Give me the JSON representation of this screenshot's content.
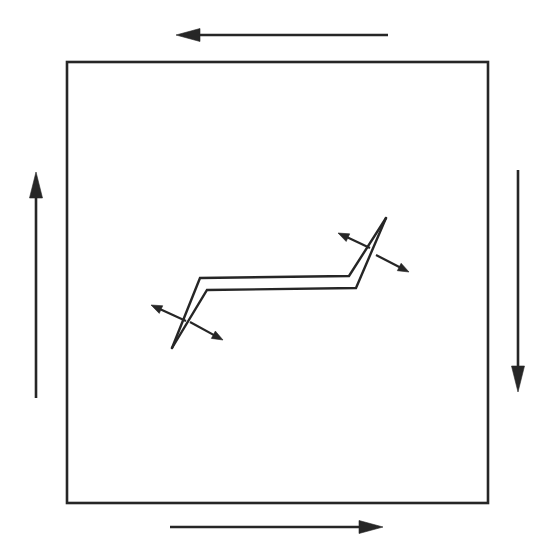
{
  "figure": {
    "title": "Zigzag shear band within a square domain under counterclockwise boundary shear",
    "background_color": "#ffffff",
    "ink_color": "#262626",
    "width": 550,
    "height": 543
  },
  "boundary": {
    "name": "square-boundary",
    "shape": "square",
    "left": 67,
    "top": 62,
    "right": 488,
    "bottom": 503,
    "stroke_color": "#262626",
    "stroke_width": 2.6,
    "fill": "none"
  },
  "circulation_arrows": [
    {
      "id": "top-shear-arrow",
      "label": "top boundary shear",
      "direction": "left",
      "orientation": "horizontal",
      "start_x": 388,
      "start_y": 35,
      "end_x": 176,
      "end_y": 35,
      "head_length": 24,
      "head_half_width": 6.5,
      "stroke_width": 2.6
    },
    {
      "id": "right-shear-arrow",
      "label": "right boundary shear",
      "direction": "down",
      "orientation": "vertical",
      "start_x": 518,
      "start_y": 170,
      "end_x": 518,
      "end_y": 392,
      "head_length": 26,
      "head_half_width": 6.5,
      "stroke_width": 2.6
    },
    {
      "id": "bottom-shear-arrow",
      "label": "bottom boundary shear",
      "direction": "right",
      "orientation": "horizontal",
      "start_x": 170,
      "start_y": 527,
      "end_x": 383,
      "end_y": 527,
      "head_length": 24,
      "head_half_width": 6.5,
      "stroke_width": 2.6
    },
    {
      "id": "left-shear-arrow",
      "label": "left boundary shear",
      "direction": "up",
      "orientation": "vertical",
      "start_x": 36,
      "start_y": 398,
      "end_x": 36,
      "end_y": 172,
      "head_length": 26,
      "head_half_width": 6.5,
      "stroke_width": 2.6
    }
  ],
  "shear_band": {
    "name": "zigzag-shear-band",
    "description": "Z-shaped double-line band with tapered tips at lower-left and upper-right",
    "stroke_color": "#262626",
    "stroke_width": 2.4,
    "upper_polyline": "172,348 200,278 349,276 386,218",
    "lower_polyline": "172,348 207,290 356,288 386,218",
    "tip_lower_left": {
      "x": 172,
      "y": 348
    },
    "tip_upper_right": {
      "x": 386,
      "y": 218
    },
    "bend_left_upper": {
      "x": 200,
      "y": 278
    },
    "bend_left_lower": {
      "x": 207,
      "y": 290
    },
    "bend_right_upper": {
      "x": 349,
      "y": 276
    },
    "bend_right_lower": {
      "x": 356,
      "y": 288
    }
  },
  "local_arrows": [
    {
      "id": "upper-right-slip-arrow-nw",
      "label": "upper-right slip direction, up-left",
      "start_x": 370,
      "start_y": 248,
      "end_x": 338,
      "end_y": 233,
      "head_length": 11,
      "head_half_width": 4.2,
      "stroke_width": 2.2
    },
    {
      "id": "upper-right-slip-arrow-se",
      "label": "upper-right slip direction, down-right",
      "start_x": 376,
      "start_y": 255,
      "end_x": 409,
      "end_y": 272,
      "head_length": 11,
      "head_half_width": 4.2,
      "stroke_width": 2.2
    },
    {
      "id": "lower-left-slip-arrow-nw",
      "label": "lower-left slip direction, up-left",
      "start_x": 186,
      "start_y": 321,
      "end_x": 151,
      "end_y": 305,
      "head_length": 11,
      "head_half_width": 4.2,
      "stroke_width": 2.2
    },
    {
      "id": "lower-left-slip-arrow-se",
      "label": "lower-left slip direction, down-right",
      "start_x": 190,
      "start_y": 322,
      "end_x": 223,
      "end_y": 340,
      "head_length": 11,
      "head_half_width": 4.2,
      "stroke_width": 2.2
    }
  ]
}
